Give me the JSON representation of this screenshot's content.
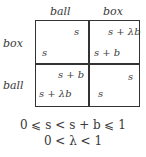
{
  "game": {
    "column_labels": [
      "ball",
      "box"
    ],
    "row_labels": [
      "box",
      "ball"
    ],
    "cells": [
      [
        {
          "top_right": "s",
          "bottom_left": "s"
        },
        {
          "top_right": "s + λb",
          "bottom_left": "s + b"
        }
      ],
      [
        {
          "top_right": "s + b",
          "bottom_left": "s + λb"
        },
        {
          "top_right": "s",
          "bottom_left": "s"
        }
      ]
    ]
  },
  "constraints": [
    "0 ⩽ s < s + b ⩽ 1",
    "0 < λ < 1"
  ]
}
